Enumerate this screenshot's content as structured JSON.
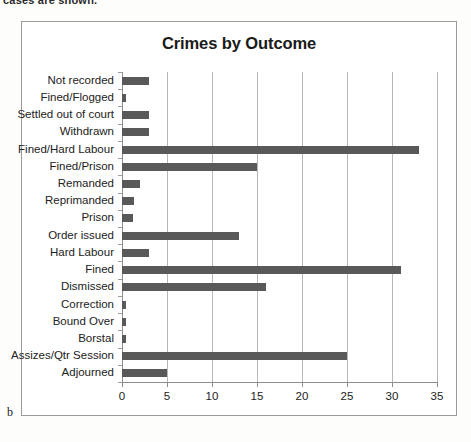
{
  "page": {
    "cut_off_text": "cases are shown.",
    "figure_caption": "b"
  },
  "chart_data": {
    "type": "bar",
    "orientation": "horizontal",
    "title": "Crimes by Outcome",
    "xlabel": "",
    "ylabel": "",
    "xlim": [
      0,
      35
    ],
    "xticks": [
      0,
      5,
      10,
      15,
      20,
      25,
      30,
      35
    ],
    "grid": "vertical",
    "legend": "none",
    "bar_color": "#595959",
    "categories": [
      "Not recorded",
      "Fined/Flogged",
      "Settled out of court",
      "Withdrawn",
      "Fined/Hard Labour",
      "Fined/Prison",
      "Remanded",
      "Reprimanded",
      "Prison",
      "Order issued",
      "Hard Labour",
      "Fined",
      "Dismissed",
      "Correction",
      "Bound Over",
      "Borstal",
      "Assizes/Qtr Session",
      "Adjourned"
    ],
    "values": [
      3,
      0.4,
      3,
      3,
      33,
      15,
      2,
      1.3,
      1.2,
      13,
      3,
      31,
      16,
      0.4,
      0.4,
      0.4,
      25,
      5
    ]
  }
}
